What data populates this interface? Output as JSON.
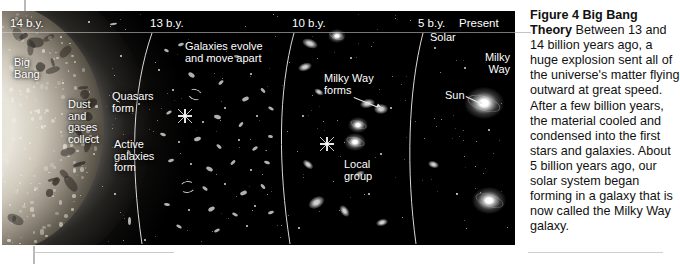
{
  "figure": {
    "caption_heading": "Figure 4  Big Bang",
    "caption_heading_2": "Theory",
    "caption_body": " Between 13 and 14 billion years ago, a huge explosion sent all of the universe's matter flying outward at great speed. After a few billion years, the material cooled and condensed into the first stars and galaxies. About 5 billion years ago, our solar system began forming in a galaxy that is now called the Milky Way galaxy."
  },
  "timeline": {
    "eras": [
      {
        "label": "14 b.y.",
        "x": 8
      },
      {
        "label": "13 b.y.",
        "x": 148
      },
      {
        "label": "10 b.y.",
        "x": 290
      },
      {
        "label": "5 b.y.",
        "x": 416
      },
      {
        "label": "Present",
        "x": 457
      }
    ]
  },
  "photo_labels": {
    "big_bang": "Big\nBang",
    "dust_gases": "Dust\nand\ngases\ncollect",
    "quasars": "Quasars\nform",
    "active_galaxies": "Active\ngalaxies\nform",
    "galaxies_evolve": "Galaxies evolve\nand move apart",
    "milky_way_forms": "Milky Way\nforms",
    "local_group": "Local\ngroup",
    "solar": "Solar",
    "sun": "Sun",
    "milky_way": "Milky\nWay"
  },
  "colors": {
    "photo_background": "#000000",
    "label_text": "#ffffff",
    "caption_text": "#111111",
    "arc_line": "#d8d8d8",
    "page_background": "#ffffff"
  }
}
